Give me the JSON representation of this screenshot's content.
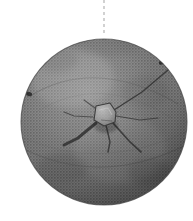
{
  "figure": {
    "name": "disc-artifact-photograph",
    "kind": "grayscale-halftone-photograph",
    "background_color": "#ffffff",
    "canvas": {
      "width": 193,
      "height": 221
    }
  },
  "suspension_line": {
    "label": "dashed-vertical-axis-line",
    "color": "#b4b4b4",
    "x": 104,
    "y_start": 0,
    "y_end": 33,
    "dash_pattern": "3 3",
    "stroke_width": 1.2
  },
  "disc": {
    "label": "stone-disc",
    "center_x": 104,
    "center_y": 122,
    "radius": 83,
    "base_color": "#8a8a8a",
    "rim_shadow_color": "#5a5a5a",
    "highlight_color": "#a8a8a8",
    "edge_outline_color": "#4a4a4a",
    "surface_texture": "coarse halftone stipple"
  },
  "boss": {
    "label": "central-boss",
    "center_x": 104,
    "center_y": 114,
    "width": 22,
    "height": 20,
    "fill_color": "#b2b2b2",
    "outline_color": "#3a3a3a",
    "description": "raised irregular knob at the centre of the disc"
  },
  "cracks": {
    "label": "radiating-cracks",
    "color": "#2e2e2e",
    "count": 7,
    "rays": [
      {
        "name": "crack-upper-right-long",
        "angle_deg": -28,
        "length": 80,
        "width": 1.4
      },
      {
        "name": "crack-right",
        "angle_deg": 8,
        "length": 46,
        "width": 1.3
      },
      {
        "name": "crack-lower-right",
        "angle_deg": 42,
        "length": 40,
        "width": 1.6
      },
      {
        "name": "crack-lower",
        "angle_deg": 80,
        "length": 34,
        "width": 1.5
      },
      {
        "name": "crack-lower-left-thick",
        "angle_deg": 152,
        "length": 44,
        "width": 3.0
      },
      {
        "name": "crack-left",
        "angle_deg": 186,
        "length": 26,
        "width": 1.2
      },
      {
        "name": "crack-upper-left",
        "angle_deg": 228,
        "length": 20,
        "width": 1.2
      }
    ]
  },
  "edge_notches": [
    {
      "name": "notch-upper-right",
      "x": 162,
      "y": 62,
      "rx": 3.4,
      "ry": 2.2,
      "rotation_deg": -35,
      "color": "#1f1f1f"
    },
    {
      "name": "notch-left",
      "x": 29,
      "y": 94,
      "rx": 3.2,
      "ry": 2.0,
      "rotation_deg": 20,
      "color": "#1f1f1f"
    }
  ],
  "surface_features": [
    {
      "name": "concentric-arc-upper",
      "description": "faint curved ridge across the upper half of the disc",
      "color": "#6e6e6e"
    },
    {
      "name": "concentric-arc-lower",
      "description": "faint curved ridge across the lower third of the disc",
      "color": "#6e6e6e"
    },
    {
      "name": "rim-band-lower-right",
      "description": "darker shaded band along the lower-right rim",
      "color": "#4f4f4f"
    },
    {
      "name": "highlight-upper-left",
      "description": "lighter patch on the upper-left face",
      "color": "#9e9e9e"
    }
  ]
}
